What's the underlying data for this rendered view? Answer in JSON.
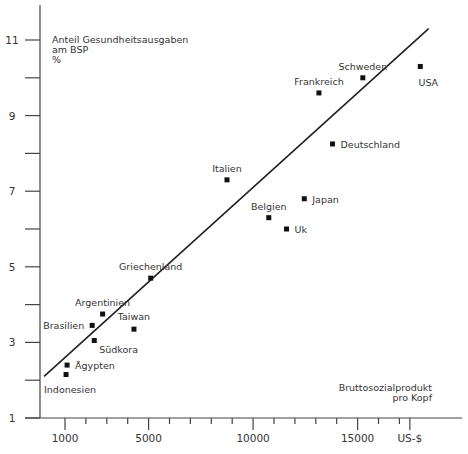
{
  "chart_data": {
    "type": "scatter",
    "title": "",
    "ylabel": "Anteil Gesundheitsausgaben am BSP %",
    "ylabel_lines": [
      "Anteil Gesundheitsausgaben",
      "am BSP",
      "%"
    ],
    "xlabel": "Bruttosozialprodukt pro Kopf",
    "xlabel_lines": [
      "Bruttosozialprodukt",
      "pro Kopf"
    ],
    "x_unit_label": "US-$",
    "x_tick_labels": [
      "1000",
      "5000",
      "10000",
      "15000",
      "US-$"
    ],
    "x_major_ticks": [
      1000,
      5000,
      10000,
      15000,
      17500
    ],
    "x_minor_tick_step": 1000,
    "y_tick_labels": [
      "1",
      "3",
      "5",
      "7",
      "9",
      "11"
    ],
    "y_major_ticks": [
      1,
      3,
      5,
      7,
      9,
      11
    ],
    "y_minor_ticks": [
      2,
      4,
      6,
      8,
      10
    ],
    "xlim": [
      -500,
      19500
    ],
    "ylim": [
      1,
      11.9
    ],
    "grid": false,
    "legend": null,
    "points": [
      {
        "label": "USA",
        "x": 18000,
        "y": 10.3,
        "label_pos": "below"
      },
      {
        "label": "Schweden",
        "x": 15250,
        "y": 10.0,
        "label_pos": "above"
      },
      {
        "label": "Frankreich",
        "x": 13150,
        "y": 9.6,
        "label_pos": "above"
      },
      {
        "label": "Deutschland",
        "x": 13800,
        "y": 8.25,
        "label_pos": "right"
      },
      {
        "label": "Italien",
        "x": 8750,
        "y": 7.3,
        "label_pos": "above"
      },
      {
        "label": "Japan",
        "x": 12450,
        "y": 6.8,
        "label_pos": "right"
      },
      {
        "label": "Belgien",
        "x": 10750,
        "y": 6.3,
        "label_pos": "above"
      },
      {
        "label": "Uk",
        "x": 11600,
        "y": 6.0,
        "label_pos": "right"
      },
      {
        "label": "Griechenland",
        "x": 5100,
        "y": 4.7,
        "label_pos": "above"
      },
      {
        "label": "Argentinien",
        "x": 2800,
        "y": 3.75,
        "label_pos": "above"
      },
      {
        "label": "Brasilien",
        "x": 2300,
        "y": 3.45,
        "label_pos": "left"
      },
      {
        "label": "Taiwan",
        "x": 4300,
        "y": 3.35,
        "label_pos": "above"
      },
      {
        "label": "Südkora",
        "x": 2400,
        "y": 3.05,
        "label_pos": "below-right"
      },
      {
        "label": "Ägypten",
        "x": 1100,
        "y": 2.4,
        "label_pos": "right"
      },
      {
        "label": "Indonesien",
        "x": 1050,
        "y": 2.15,
        "label_pos": "below"
      }
    ],
    "trendline": {
      "x0": 0,
      "y0": 2.1,
      "x1": 18400,
      "y1": 11.3
    }
  }
}
